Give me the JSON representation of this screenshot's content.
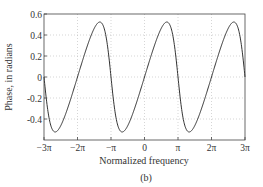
{
  "chart_data": {
    "type": "line",
    "title": "",
    "xlabel": "Normalized frequency",
    "ylabel": "Phase, in radians",
    "caption": "(b)",
    "xlim": [
      -9.42477796,
      9.42477796
    ],
    "ylim": [
      -0.6,
      0.6
    ],
    "grid": true,
    "legend": "none",
    "x_ticks": [
      {
        "value": -9.42477796,
        "label": "−3π"
      },
      {
        "value": -6.28318531,
        "label": "−2π"
      },
      {
        "value": -3.14159265,
        "label": "−π"
      },
      {
        "value": 0,
        "label": "0"
      },
      {
        "value": 3.14159265,
        "label": "π"
      },
      {
        "value": 6.28318531,
        "label": "2π"
      },
      {
        "value": 9.42477796,
        "label": "3π"
      }
    ],
    "y_ticks": [
      {
        "value": 0.6,
        "label": "0.6"
      },
      {
        "value": 0.4,
        "label": "0.4"
      },
      {
        "value": 0.2,
        "label": "0.2"
      },
      {
        "value": 0,
        "label": "0"
      },
      {
        "value": -0.2,
        "label": "-0.2"
      },
      {
        "value": -0.4,
        "label": "-0.4"
      }
    ],
    "series": [
      {
        "name": "phase",
        "description": "phi(w) = atan(0.5 sin w / (1 + 0.5 cos w)), periodic with period 2π, peak ≈ 0.52 at w = 2π/3 + 2kπ, min ≈ -0.52 at w = -2π/3 + 2kπ",
        "x": [
          -9.4248,
          -8.3776,
          -7.3304,
          -6.2832,
          -5.236,
          -4.1888,
          -3.1416,
          -2.0944,
          -1.0472,
          0,
          1.0472,
          2.0944,
          3.1416,
          4.1888,
          5.236,
          6.2832,
          7.3304,
          8.3776,
          9.4248
        ],
        "values": [
          0,
          -0.5236,
          -0.3335,
          0,
          0.3335,
          0.5236,
          0,
          -0.5236,
          -0.3335,
          0,
          0.3335,
          0.5236,
          0,
          -0.5236,
          -0.3335,
          0,
          0.3335,
          0.5236,
          0
        ],
        "formula_a": 0.5,
        "color": "#333333"
      }
    ]
  }
}
